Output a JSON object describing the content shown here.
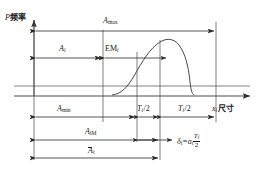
{
  "figure": {
    "axes": {
      "y_axis_label_symbol": "P",
      "y_axis_label_text": "频率",
      "x_axis_label_symbol": "x",
      "x_axis_label_sub": "i",
      "x_axis_label_text": "尺寸"
    },
    "dimension_lines": [
      {
        "id": "a-max",
        "symbol": "A",
        "sub": "max",
        "sub_italic": false,
        "label": "A max"
      },
      {
        "id": "a-i",
        "symbol": "A",
        "sub": "i",
        "sub_italic": true,
        "label": "A i"
      },
      {
        "id": "em-i",
        "symbol": "EM",
        "sub": "i",
        "sub_italic": true,
        "label": "EM i"
      },
      {
        "id": "a-min",
        "symbol": "A",
        "sub": "min",
        "sub_italic": false,
        "label": "A min"
      },
      {
        "id": "t-half-left",
        "symbol": "T",
        "sub": "i",
        "divisor": "/2",
        "label": "T i /2"
      },
      {
        "id": "t-half-right",
        "symbol": "T",
        "sub": "i",
        "divisor": "/2",
        "label": "T i /2"
      },
      {
        "id": "a-iM",
        "symbol": "A",
        "sub": "iM",
        "sub_italic": false,
        "label": "A iM"
      },
      {
        "id": "a-i-bar",
        "symbol": "A",
        "sub": "i",
        "overbar": true,
        "label": "A i bar"
      }
    ],
    "formula": {
      "lhs_symbol": "δ",
      "lhs_sub": "i",
      "equals": "=",
      "rhs_symbol": "a",
      "rhs_sub": "i",
      "fraction_numerator": "T",
      "fraction_numerator_sub": "i",
      "fraction_denominator": "2",
      "plain": "δi = ai Ti/2"
    },
    "colors": {
      "ink": "#1a1a1a",
      "line": "#3a3a3a",
      "background": "#ffffff"
    }
  }
}
